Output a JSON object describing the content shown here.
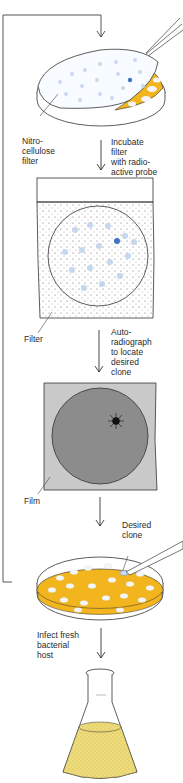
{
  "labels": {
    "nitrocellulose_filter": "Nitro-\ncellulose\nfilter",
    "step_incubate": "Incubate\nfilter\nwith radio-\nactive probe",
    "filter": "Filter",
    "step_autoradiograph": "Auto-\nradiograph\nto locate\ndesired\nclone",
    "film": "Film",
    "desired_clone": "Desired\nclone",
    "step_infect": "Infect fresh\nbacterial\nhost"
  },
  "colors": {
    "agar_yellow": "#f2b51e",
    "colony_white": "#f4f6fb",
    "colony_blue": "#a9c4e6",
    "positive_spot": "#3f74c4",
    "film_dark": "#8c8c8c",
    "film_light": "#c9c9c9",
    "culture_yellow": "#eedb7a",
    "line": "#333333"
  },
  "diagram": {
    "type": "process-flow",
    "steps": [
      "Lift colonies onto nitrocellulose filter",
      "Incubate filter with radioactive probe",
      "Autoradiograph to locate desired clone",
      "Pick desired clone from plate",
      "Infect fresh bacterial host"
    ]
  }
}
